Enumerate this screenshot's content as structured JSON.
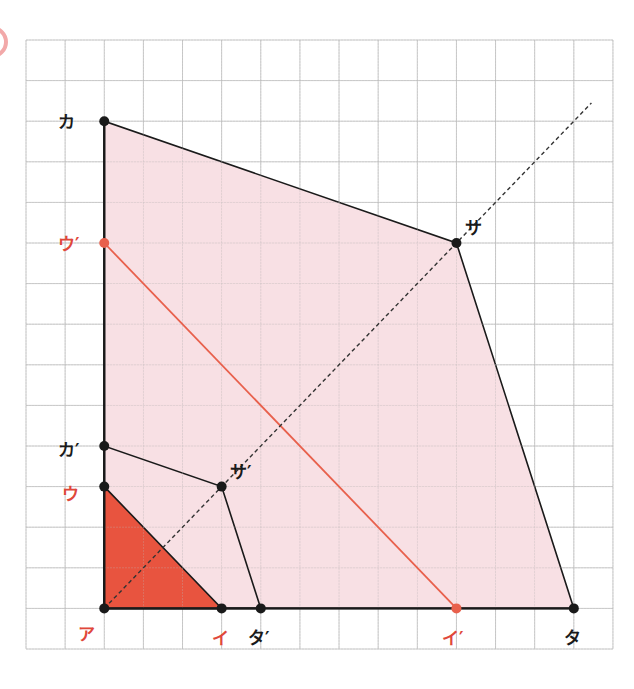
{
  "diagram": {
    "grid": {
      "x0": 26,
      "y0": 40,
      "cols": 15,
      "rows": 15,
      "cell_w": 39.13,
      "cell_h": 40.6,
      "color": "#bdbdbd"
    },
    "colors": {
      "pink_fill": "#F7DADF",
      "red_fill": "#E8543F",
      "red_line": "#E8604C",
      "red_label": "#E0473A",
      "black": "#1a1a1a",
      "marker_partial": "#F2A9A9"
    },
    "points": [
      {
        "id": "a",
        "label": "ア",
        "col": 2,
        "row": 14,
        "color": "black",
        "label_color": "red",
        "lx": 78,
        "ly": 640
      },
      {
        "id": "i",
        "label": "イ",
        "col": 5,
        "row": 14,
        "color": "black",
        "label_color": "red",
        "lx": 212,
        "ly": 644
      },
      {
        "id": "u",
        "label": "ウ",
        "col": 2,
        "row": 11,
        "color": "black",
        "label_color": "red",
        "lx": 62,
        "ly": 500
      },
      {
        "id": "ka",
        "label": "カ",
        "col": 2,
        "row": 2,
        "color": "black",
        "label_color": "black",
        "lx": 58,
        "ly": 128
      },
      {
        "id": "ka2",
        "label": "カ′",
        "col": 2,
        "row": 10,
        "color": "black",
        "label_color": "black",
        "lx": 58,
        "ly": 456
      },
      {
        "id": "sa2",
        "label": "サ′",
        "col": 5,
        "row": 11,
        "color": "black",
        "label_color": "black",
        "lx": 230,
        "ly": 478
      },
      {
        "id": "ta2",
        "label": "タ′",
        "col": 6,
        "row": 14,
        "color": "black",
        "label_color": "black",
        "lx": 248,
        "ly": 644
      },
      {
        "id": "sa",
        "label": "サ",
        "col": 11,
        "row": 5,
        "color": "black",
        "label_color": "black",
        "lx": 465,
        "ly": 234
      },
      {
        "id": "ta",
        "label": "タ",
        "col": 14,
        "row": 14,
        "color": "black",
        "label_color": "black",
        "lx": 564,
        "ly": 644
      },
      {
        "id": "u2",
        "label": "ウ′",
        "col": 2,
        "row": 5,
        "color": "red",
        "label_color": "red",
        "lx": 58,
        "ly": 250
      },
      {
        "id": "i2",
        "label": "イ′",
        "col": 11,
        "row": 14,
        "color": "red",
        "label_color": "red",
        "lx": 442,
        "ly": 644
      }
    ],
    "polygons": [
      {
        "name": "large-quadrilateral",
        "vertices": [
          "a",
          "ka",
          "sa",
          "ta"
        ],
        "fill": "pink_fill",
        "stroke": "black"
      },
      {
        "name": "small-quadrilateral",
        "vertices": [
          "a",
          "ka2",
          "sa2",
          "ta2"
        ],
        "fill": "none",
        "stroke": "black"
      },
      {
        "name": "red-triangle",
        "vertices": [
          "a",
          "i",
          "u"
        ],
        "fill": "red_fill",
        "stroke": "black"
      }
    ],
    "segments": [
      {
        "name": "red-segment-u2-i2",
        "from": "u2",
        "to": "i2",
        "color": "red_line"
      }
    ],
    "dashed_line": {
      "from": "a",
      "to_col": 14.45,
      "to_row": 1.55
    }
  }
}
